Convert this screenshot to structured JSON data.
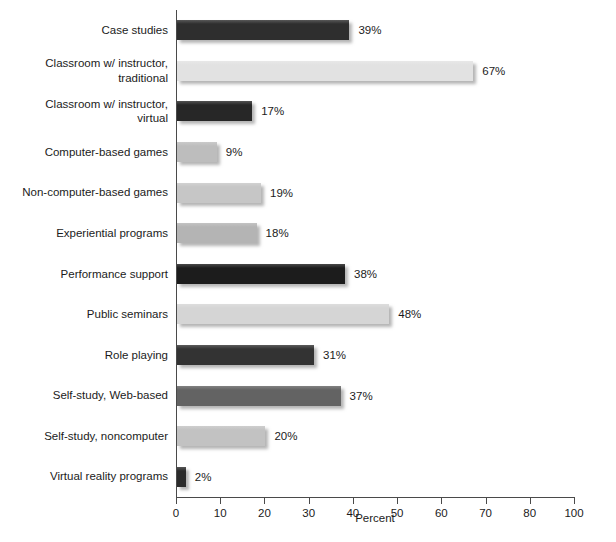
{
  "chart_data": {
    "type": "bar",
    "orientation": "horizontal",
    "title": "",
    "xlabel": "Percent",
    "ylabel": "",
    "xlim": [
      0,
      90
    ],
    "grid": false,
    "legend": false,
    "tick_labels": [
      "0",
      "10",
      "20",
      "30",
      "40",
      "50",
      "60",
      "70",
      "80",
      "100"
    ],
    "tick_positions": [
      0,
      10,
      20,
      30,
      40,
      50,
      60,
      70,
      80,
      90
    ],
    "categories": [
      "Case studies",
      "Classroom w/ instructor,\ntraditional",
      "Classroom w/ instructor,\nvirtual",
      "Computer-based games",
      "Non-computer-based games",
      "Experiential programs",
      "Performance support",
      "Public seminars",
      "Role playing",
      "Self-study, Web-based",
      "Self-study, noncomputer",
      "Virtual reality programs"
    ],
    "values": [
      39,
      67,
      17,
      9,
      19,
      18,
      38,
      48,
      31,
      37,
      20,
      2
    ],
    "value_labels": [
      "39%",
      "67%",
      "17%",
      "9%",
      "19%",
      "18%",
      "38%",
      "48%",
      "31%",
      "37%",
      "20%",
      "2%"
    ],
    "bar_colors": [
      "#2e2e2e",
      "#e2e2e2",
      "#272727",
      "#bdbdbd",
      "#c6c6c6",
      "#b4b4b4",
      "#1c1c1c",
      "#d5d5d5",
      "#333333",
      "#636363",
      "#c2c2c2",
      "#2b2b2b"
    ]
  },
  "style": {
    "background": "#ffffff",
    "axis_color": "#4a4a4a",
    "text_color": "#1b1b1b"
  }
}
